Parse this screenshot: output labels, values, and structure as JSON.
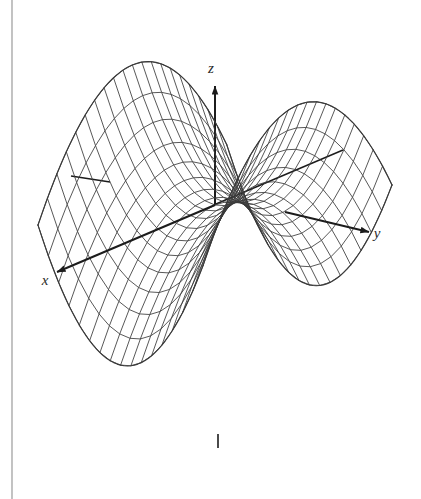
{
  "figure": {
    "kind": "3d-surface-plot",
    "background_color": "#ffffff",
    "mesh_color": "#3a3a3a",
    "axis_color": "#1c1c1c",
    "page_edge_color": "#9a9a9a",
    "axes": {
      "z": {
        "label": "z",
        "label_x": 211,
        "label_y": 73,
        "from": [
          215,
          205
        ],
        "to": [
          215,
          86
        ],
        "arrow": true
      },
      "y": {
        "label": "y",
        "label_x": 377,
        "label_y": 238,
        "from": [
          285,
          212
        ],
        "to": [
          369,
          232
        ],
        "arrow": true
      },
      "x": {
        "label": "x",
        "label_x": 45,
        "label_y": 285,
        "from": [
          215,
          205
        ],
        "to": [
          57,
          272
        ],
        "arrow": true
      },
      "neg_x_stub": {
        "from": [
          216,
          204
        ],
        "to": [
          343,
          150
        ],
        "arrow": false
      },
      "neg_y_stub": {
        "from": [
          110,
          182
        ],
        "to": [
          71,
          176
        ],
        "arrow": false
      },
      "bottom_tick": {
        "from": [
          218,
          434
        ],
        "to": [
          218,
          448
        ]
      }
    },
    "page_edge": {
      "x": 12,
      "from_y": 0,
      "to_y": 499
    },
    "surface": {
      "equation": "z = y^2 - x^2",
      "u_range": [
        -1,
        1
      ],
      "v_range": [
        -1,
        1
      ],
      "u_divisions": 20,
      "v_divisions": 16,
      "origin_px": [
        215,
        205
      ],
      "saddle_peak_left_px": [
        135,
        137
      ],
      "saddle_peak_right_px": [
        310,
        172
      ],
      "lowest_front_px": [
        218,
        434
      ]
    }
  },
  "chart_data": {
    "type": "surface",
    "title": "",
    "xlabel": "x",
    "ylabel": "y",
    "zlabel": "z",
    "equation": "z = y^2 - x^2",
    "domain": {
      "x": [
        -1,
        1
      ],
      "y": [
        -1,
        1
      ]
    },
    "zrange": [
      -1,
      1
    ],
    "grid": true,
    "legend": "none",
    "projection": {
      "note": "oblique view, z vertical, x toward lower-left, y toward lower-right",
      "ex": [
        -0.8,
        0.34
      ],
      "ey": [
        0.7,
        0.17
      ],
      "ez": [
        0.0,
        -1.0
      ]
    }
  }
}
